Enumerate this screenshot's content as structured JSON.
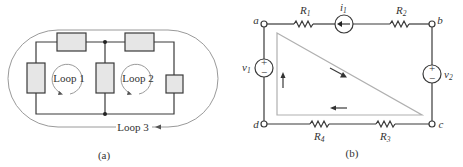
{
  "figure_a": {
    "caption": "(a)",
    "loops": [
      {
        "label": "Loop 1"
      },
      {
        "label": "Loop 2"
      },
      {
        "label": "Loop 3"
      }
    ],
    "colors": {
      "component_fill": "#e6e6e6",
      "wire": "#3a3a3a",
      "loop_path": "#9a9a9a"
    }
  },
  "figure_b": {
    "caption": "(b)",
    "nodes": {
      "a": "a",
      "b": "b",
      "c": "c",
      "d": "d"
    },
    "components": {
      "R1": {
        "name": "R",
        "sub": "1"
      },
      "R2": {
        "name": "R",
        "sub": "2"
      },
      "R3": {
        "name": "R",
        "sub": "3"
      },
      "R4": {
        "name": "R",
        "sub": "4"
      },
      "i1": {
        "name": "i",
        "sub": "1"
      },
      "v1": {
        "name": "v",
        "sub": "1",
        "plus": "+",
        "minus": "−"
      },
      "v2": {
        "name": "v",
        "sub": "2",
        "plus": "+",
        "minus": "−"
      }
    },
    "colors": {
      "loop_path": "#b0b0b0",
      "wire": "#3a3a3a"
    }
  }
}
